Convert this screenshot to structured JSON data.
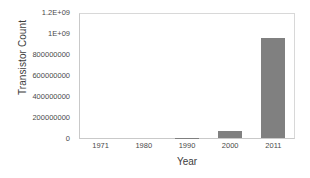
{
  "chart_data": {
    "type": "bar",
    "title": "",
    "xlabel": "Year",
    "ylabel": "Transistor Count",
    "categories": [
      "1971",
      "1980",
      "1990",
      "2000",
      "2011"
    ],
    "values": [
      2300,
      29000,
      1200000,
      65000000,
      970000000
    ],
    "ylim": [
      0,
      1200000000
    ],
    "ytick_values": [
      0,
      200000000,
      400000000,
      600000000,
      800000000,
      1000000000,
      1200000000
    ],
    "ytick_labels": [
      "0",
      "200000000",
      "400000000",
      "600000000",
      "800000000",
      "1E+09",
      "1.2E+09"
    ],
    "grid": false,
    "legend": null,
    "bar_color": "#808080",
    "axis_color": "#c9c9c9",
    "background_color": "#ffffff"
  }
}
